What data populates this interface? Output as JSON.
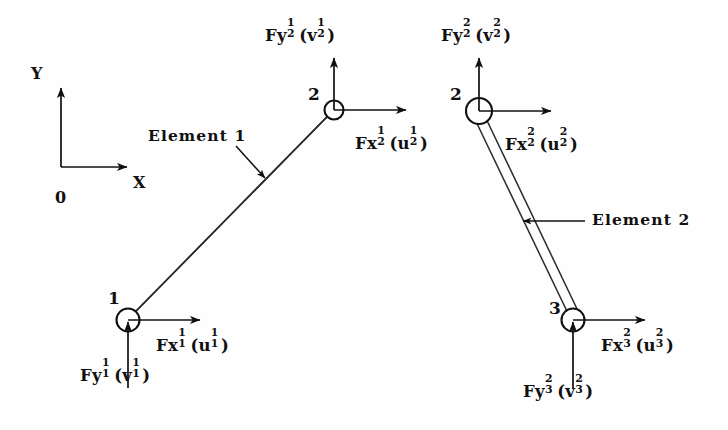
{
  "figure": {
    "background_color": "#fefefe",
    "ink_color": "#101010"
  },
  "axes": {
    "origin_label": "0",
    "x_label": "X",
    "y_label": "Y"
  },
  "elements": [
    {
      "id": "element-1",
      "label": "Element 1"
    },
    {
      "id": "element-2",
      "label": "Element 2"
    }
  ],
  "nodes": [
    {
      "id": "node-1-left",
      "number": "1"
    },
    {
      "id": "node-2-left",
      "number": "2"
    },
    {
      "id": "node-2-right",
      "number": "2"
    },
    {
      "id": "node-3-right",
      "number": "3"
    }
  ],
  "force_labels": {
    "fy2_e1": {
      "base": "Fy",
      "sup": "1",
      "sub": "2",
      "disp_base": "v",
      "disp_sup": "1",
      "disp_sub": "2"
    },
    "fx2_e1": {
      "base": "Fx",
      "sup": "1",
      "sub": "2",
      "disp_base": "u",
      "disp_sup": "1",
      "disp_sub": "2"
    },
    "fy1_e1": {
      "base": "Fy",
      "sup": "1",
      "sub": "1",
      "disp_base": "v",
      "disp_sup": "1",
      "disp_sub": "1"
    },
    "fx1_e1": {
      "base": "Fx",
      "sup": "1",
      "sub": "1",
      "disp_base": "u",
      "disp_sup": "1",
      "disp_sub": "1"
    },
    "fy2_e2": {
      "base": "Fy",
      "sup": "2",
      "sub": "2",
      "disp_base": "v",
      "disp_sup": "2",
      "disp_sub": "2"
    },
    "fx2_e2": {
      "base": "Fx",
      "sup": "2",
      "sub": "2",
      "disp_base": "u",
      "disp_sup": "2",
      "disp_sub": "2"
    },
    "fy3_e2": {
      "base": "Fy",
      "sup": "2",
      "sub": "3",
      "disp_base": "v",
      "disp_sup": "2",
      "disp_sub": "3"
    },
    "fx3_e2": {
      "base": "Fx",
      "sup": "2",
      "sub": "3",
      "disp_base": "u",
      "disp_sup": "2",
      "disp_sub": "3"
    }
  },
  "punctuation": {
    "open_paren": "(",
    "close_paren": ")"
  }
}
